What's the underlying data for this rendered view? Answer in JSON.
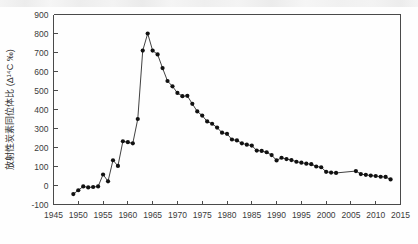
{
  "chart_data": {
    "type": "line",
    "title": "",
    "subtitle": "",
    "xlabel": "",
    "ylabel": "放射性炭素同位体比 (Δ14C ‰)",
    "ylabel_display": "放射性炭素同位体比 (Δ¹⁴C ‰)",
    "xlim": [
      1945,
      2015
    ],
    "ylim": [
      -100,
      900
    ],
    "xticks": [
      1945,
      1950,
      1955,
      1960,
      1965,
      1970,
      1975,
      1980,
      1985,
      1990,
      1995,
      2000,
      2005,
      2010,
      2015
    ],
    "yticks": [
      -100,
      0,
      100,
      200,
      300,
      400,
      500,
      600,
      700,
      800,
      900
    ],
    "xtick_labels": [
      "1945",
      "1950",
      "1955",
      "1960",
      "1965",
      "1970",
      "1975",
      "1980",
      "1985",
      "1990",
      "1995",
      "2000",
      "2005",
      "2010",
      "2015"
    ],
    "ytick_labels": [
      "-100",
      "0",
      "100",
      "200",
      "300",
      "400",
      "500",
      "600",
      "700",
      "800",
      "900"
    ],
    "grid": false,
    "legend": false,
    "legend_position": "none",
    "marker": "filled-circle",
    "line_color": "#2b2b2b",
    "marker_color": "#111111",
    "axis_color": "#4a4a4a",
    "background_color": "#fefefe",
    "x": [
      1949,
      1950,
      1951,
      1952,
      1953,
      1954,
      1955,
      1956,
      1957,
      1958,
      1959,
      1960,
      1961,
      1962,
      1963,
      1964,
      1965,
      1966,
      1967,
      1968,
      1969,
      1970,
      1971,
      1972,
      1973,
      1974,
      1975,
      1976,
      1977,
      1978,
      1979,
      1980,
      1981,
      1982,
      1983,
      1984,
      1985,
      1986,
      1987,
      1988,
      1989,
      1990,
      1991,
      1992,
      1993,
      1994,
      1995,
      1996,
      1997,
      1998,
      1999,
      2000,
      2001,
      2002,
      2006,
      2007,
      2008,
      2009,
      2010,
      2011,
      2012,
      2013
    ],
    "y": [
      -45,
      -25,
      -5,
      -10,
      -8,
      -5,
      58,
      22,
      133,
      103,
      233,
      228,
      222,
      350,
      710,
      800,
      710,
      690,
      618,
      550,
      522,
      487,
      470,
      472,
      430,
      390,
      368,
      337,
      325,
      305,
      278,
      272,
      242,
      237,
      222,
      215,
      210,
      184,
      182,
      175,
      160,
      132,
      146,
      139,
      134,
      125,
      120,
      115,
      112,
      100,
      96,
      72,
      68,
      66,
      76,
      60,
      56,
      52,
      50,
      46,
      45,
      32
    ],
    "series": [
      {
        "name": "atmospheric-radiocarbon",
        "values": [
          -45,
          -25,
          -5,
          -10,
          -8,
          -5,
          58,
          22,
          133,
          103,
          233,
          228,
          222,
          350,
          710,
          800,
          710,
          690,
          618,
          550,
          522,
          487,
          470,
          472,
          430,
          390,
          368,
          337,
          325,
          305,
          278,
          272,
          242,
          237,
          222,
          215,
          210,
          184,
          182,
          175,
          160,
          132,
          146,
          139,
          134,
          125,
          120,
          115,
          112,
          100,
          96,
          72,
          68,
          66,
          76,
          60,
          56,
          52,
          50,
          46,
          45,
          32
        ]
      }
    ],
    "gaps": [
      {
        "after_x": 2002,
        "before_x": 2006
      }
    ],
    "annotations": []
  }
}
